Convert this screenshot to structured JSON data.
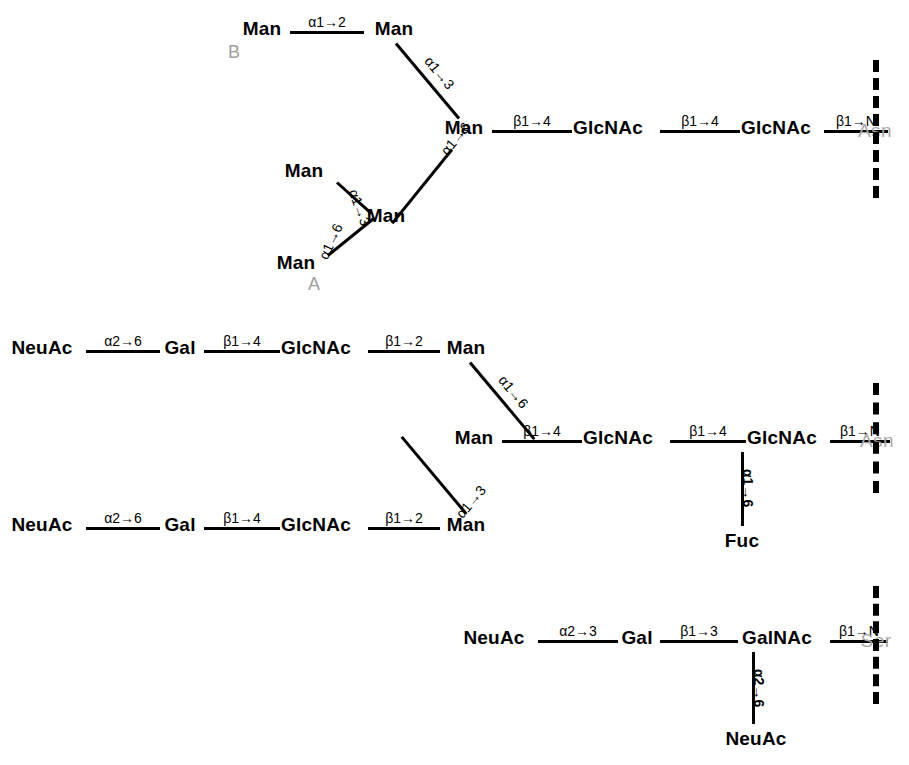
{
  "figure": {
    "type": "glycan-structure-diagram",
    "background_color": "#ffffff",
    "residue_color": "#000000",
    "aglycone_color": "#a8a8a8",
    "annotation_color": "#a0a0a0"
  },
  "structures": [
    {
      "id": "high-mannose-n-glycan",
      "annotations": [
        {
          "label": "B"
        },
        {
          "label": "A"
        }
      ],
      "residues": [
        {
          "label": "Man"
        },
        {
          "label": "Man"
        },
        {
          "label": "Man"
        },
        {
          "label": "Man"
        },
        {
          "label": "Man"
        },
        {
          "label": "Man"
        },
        {
          "label": "GlcNAc"
        },
        {
          "label": "GlcNAc"
        }
      ],
      "aglycone": "Asn",
      "linkages": [
        {
          "label": "α1→2"
        },
        {
          "label": "α1→3"
        },
        {
          "label": "α1→6"
        },
        {
          "label": "α1→3"
        },
        {
          "label": "α1→6"
        },
        {
          "label": "β1→4"
        },
        {
          "label": "β1→4"
        },
        {
          "label": "β1→N"
        }
      ]
    },
    {
      "id": "biantennary-sialylated-fucosylated-n-glycan",
      "residues": [
        {
          "label": "NeuAc"
        },
        {
          "label": "Gal"
        },
        {
          "label": "GlcNAc"
        },
        {
          "label": "Man"
        },
        {
          "label": "NeuAc"
        },
        {
          "label": "Gal"
        },
        {
          "label": "GlcNAc"
        },
        {
          "label": "Man"
        },
        {
          "label": "Man"
        },
        {
          "label": "GlcNAc"
        },
        {
          "label": "GlcNAc"
        },
        {
          "label": "Fuc"
        }
      ],
      "aglycone": "Asn",
      "linkages": [
        {
          "label": "α2→6"
        },
        {
          "label": "β1→4"
        },
        {
          "label": "β1→2"
        },
        {
          "label": "α1→6"
        },
        {
          "label": "α2→6"
        },
        {
          "label": "β1→4"
        },
        {
          "label": "β1→2"
        },
        {
          "label": "α1→3"
        },
        {
          "label": "β1→4"
        },
        {
          "label": "β1→4"
        },
        {
          "label": "β1→N"
        },
        {
          "label": "α1→6"
        }
      ]
    },
    {
      "id": "disialyl-core1-o-glycan",
      "residues": [
        {
          "label": "NeuAc"
        },
        {
          "label": "Gal"
        },
        {
          "label": "GalNAc"
        },
        {
          "label": "NeuAc"
        }
      ],
      "aglycone": "Ser",
      "linkages": [
        {
          "label": "α2→3"
        },
        {
          "label": "β1→3"
        },
        {
          "label": "β1→N"
        },
        {
          "label": "α2→6"
        }
      ]
    }
  ],
  "labels": {
    "man": "Man",
    "glcnac": "GlcNAc",
    "galnac": "GalNAc",
    "gal": "Gal",
    "neuac": "NeuAc",
    "fuc": "Fuc",
    "asn": "Asn",
    "ser": "Ser",
    "annot_a": "A",
    "annot_b": "B",
    "a1_2": "α1→2",
    "a1_3": "α1→3",
    "a1_6": "α1→6",
    "a2_3": "α2→3",
    "a2_6": "α2→6",
    "b1_2": "β1→2",
    "b1_3": "β1→3",
    "b1_4": "β1→4",
    "b1_N": "β1→N"
  }
}
